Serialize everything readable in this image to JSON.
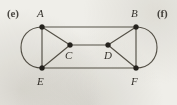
{
  "figure": {
    "background_color": "#efeee9",
    "ink_color": "#575349",
    "vertex_color": "#26231e",
    "part_labels": {
      "left": "(e)",
      "right": "(f)"
    },
    "vertices": [
      {
        "id": "A",
        "label": "A",
        "x": 42,
        "y": 27
      },
      {
        "id": "B",
        "label": "B",
        "x": 136,
        "y": 27
      },
      {
        "id": "C",
        "label": "C",
        "x": 70,
        "y": 45
      },
      {
        "id": "D",
        "label": "D",
        "x": 108,
        "y": 45
      },
      {
        "id": "E",
        "label": "E",
        "x": 42,
        "y": 68
      },
      {
        "id": "F",
        "label": "F",
        "x": 136,
        "y": 68
      }
    ],
    "edges": [
      {
        "from": "A",
        "to": "B",
        "kind": "straight"
      },
      {
        "from": "E",
        "to": "F",
        "kind": "straight"
      },
      {
        "from": "A",
        "to": "E",
        "kind": "straight"
      },
      {
        "from": "B",
        "to": "F",
        "kind": "straight"
      },
      {
        "from": "A",
        "to": "C",
        "kind": "straight"
      },
      {
        "from": "C",
        "to": "E",
        "kind": "straight"
      },
      {
        "from": "B",
        "to": "D",
        "kind": "straight"
      },
      {
        "from": "D",
        "to": "F",
        "kind": "straight"
      },
      {
        "from": "C",
        "to": "D",
        "kind": "straight"
      },
      {
        "from": "A",
        "to": "E",
        "kind": "arc-left"
      },
      {
        "from": "B",
        "to": "F",
        "kind": "arc-right"
      }
    ],
    "graph_summary": {
      "vertex_count": 6,
      "edge_count": 11
    }
  }
}
